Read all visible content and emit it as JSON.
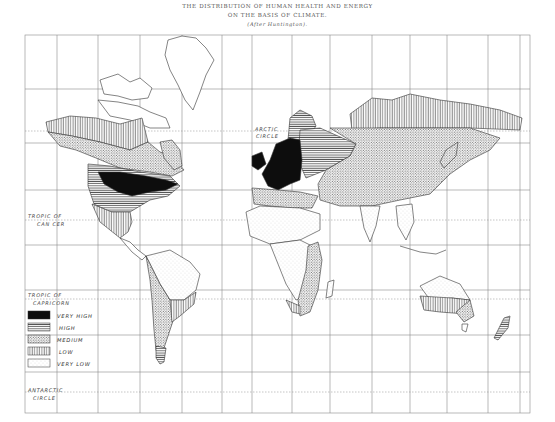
{
  "title": {
    "line1": "THE DISTRIBUTION OF HUMAN HEALTH AND ENERGY",
    "line2": "ON THE BASIS OF CLIMATE.",
    "line3": "(After Huntington)."
  },
  "map_labels": {
    "arctic_circle_1": "ARCTIC",
    "arctic_circle_2": "CIRCLE",
    "tropic_cancer_1": "TROPIC OF",
    "tropic_cancer_2": "CAN CER",
    "tropic_capricorn_1": "TROPIC OF",
    "tropic_capricorn_2": "CAPRICORN",
    "antarctic_circle_1": "ANTARCTIC",
    "antarctic_circle_2": "CIRCLE"
  },
  "legend": {
    "items": [
      {
        "label": "VERY HIGH",
        "pattern": "solid-black"
      },
      {
        "label": "HIGH",
        "pattern": "horizontal-lines"
      },
      {
        "label": "MEDIUM",
        "pattern": "dense-dots"
      },
      {
        "label": "LOW",
        "pattern": "vertical-lines"
      },
      {
        "label": "VERY LOW",
        "pattern": "sparse-dots"
      }
    ]
  },
  "colors": {
    "ink": "#1a1a1a",
    "grid": "#8a8a8a",
    "paper": "#ffffff"
  }
}
